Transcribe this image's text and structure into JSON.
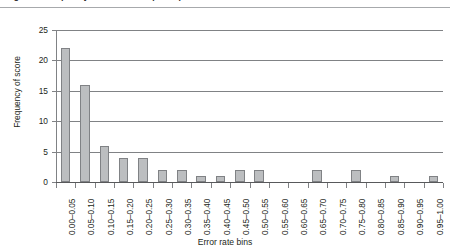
{
  "caption": {
    "text": "Figure 3. Frequency distribution of participant error rates across bins"
  },
  "chart_data": {
    "type": "bar",
    "title": "",
    "subtitle": "",
    "xlabel": "Error rate bins",
    "ylabel": "Frequency of score",
    "categories": [
      "0.00–0.05",
      "0.05–0.10",
      "0.10–0.15",
      "0.15–0.20",
      "0.20–0.25",
      "0.25–0.30",
      "0.30–0.35",
      "0.35–0.40",
      "0.40–0.45",
      "0.45–0.50",
      "0.50–0.55",
      "0.55–0.60",
      "0.60–0.65",
      "0.65–0.70",
      "0.70–0.75",
      "0.75–0.80",
      "0.80–0.85",
      "0.85–0.90",
      "0.90–0.95",
      "0.95–1.00"
    ],
    "values": [
      22,
      16,
      6,
      4,
      4,
      2,
      2,
      1,
      1,
      2,
      2,
      0,
      0,
      2,
      0,
      2,
      0,
      1,
      0,
      1
    ],
    "ylim": [
      0,
      25
    ],
    "yticks": [
      0,
      5,
      10,
      15,
      20,
      25
    ],
    "ytick_labels": [
      "0",
      "5",
      "10",
      "15",
      "20",
      "25"
    ],
    "grid": "horizontal",
    "legend": "none",
    "bar_color": "#bcbec0",
    "bar_border_color": "#808285",
    "axis_color": "#808285",
    "text_color": "#231f20"
  }
}
